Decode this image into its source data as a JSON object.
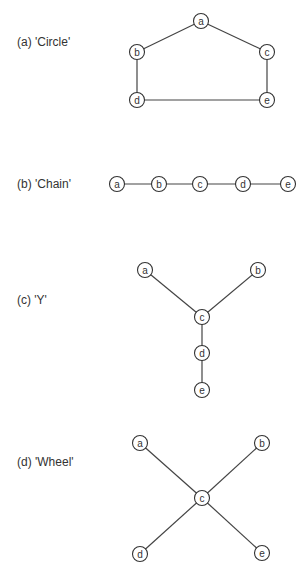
{
  "node_radius": 7.5,
  "panels": [
    {
      "id": "circle",
      "label": "(a) 'Circle'",
      "label_y": 42,
      "nodes": [
        {
          "id": "a",
          "x": 201,
          "y": 21
        },
        {
          "id": "b",
          "x": 137,
          "y": 52
        },
        {
          "id": "c",
          "x": 267,
          "y": 52
        },
        {
          "id": "d",
          "x": 137,
          "y": 100
        },
        {
          "id": "e",
          "x": 267,
          "y": 100
        }
      ],
      "edges": [
        [
          "a",
          "b"
        ],
        [
          "a",
          "c"
        ],
        [
          "b",
          "d"
        ],
        [
          "c",
          "e"
        ],
        [
          "d",
          "e"
        ]
      ]
    },
    {
      "id": "chain",
      "label": "(b) 'Chain'",
      "label_y": 184,
      "nodes": [
        {
          "id": "a",
          "x": 117,
          "y": 184
        },
        {
          "id": "b",
          "x": 159,
          "y": 184
        },
        {
          "id": "c",
          "x": 200,
          "y": 184
        },
        {
          "id": "d",
          "x": 243,
          "y": 184
        },
        {
          "id": "e",
          "x": 288,
          "y": 184
        }
      ],
      "edges": [
        [
          "a",
          "b"
        ],
        [
          "b",
          "c"
        ],
        [
          "c",
          "d"
        ],
        [
          "d",
          "e"
        ]
      ]
    },
    {
      "id": "y",
      "label": "(c) 'Y'",
      "label_y": 300,
      "nodes": [
        {
          "id": "a",
          "x": 145,
          "y": 270
        },
        {
          "id": "b",
          "x": 258,
          "y": 270
        },
        {
          "id": "c",
          "x": 202,
          "y": 317
        },
        {
          "id": "d",
          "x": 202,
          "y": 353
        },
        {
          "id": "e",
          "x": 202,
          "y": 390
        }
      ],
      "edges": [
        [
          "a",
          "c"
        ],
        [
          "b",
          "c"
        ],
        [
          "c",
          "d"
        ],
        [
          "d",
          "e"
        ]
      ]
    },
    {
      "id": "wheel",
      "label": "(d) 'Wheel'",
      "label_y": 462,
      "nodes": [
        {
          "id": "a",
          "x": 140,
          "y": 443
        },
        {
          "id": "b",
          "x": 262,
          "y": 443
        },
        {
          "id": "c",
          "x": 202,
          "y": 498
        },
        {
          "id": "d",
          "x": 140,
          "y": 554
        },
        {
          "id": "e",
          "x": 262,
          "y": 553
        }
      ],
      "edges": [
        [
          "a",
          "c"
        ],
        [
          "b",
          "c"
        ],
        [
          "c",
          "d"
        ],
        [
          "c",
          "e"
        ]
      ]
    }
  ]
}
